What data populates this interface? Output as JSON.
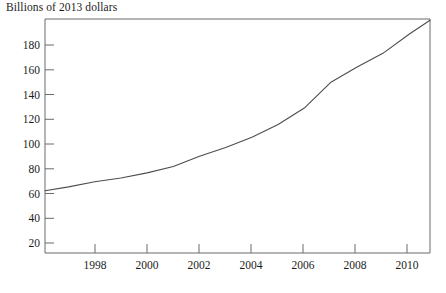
{
  "chart": {
    "title": "Billions of 2013 dollars",
    "y_ticks": [
      "20",
      "40",
      "60",
      "80",
      "100",
      "120",
      "140",
      "160",
      "180"
    ],
    "x_ticks": [
      "1998",
      "2000",
      "2002",
      "2004",
      "2006",
      "2008",
      "2010"
    ],
    "line_color": "#4d4d4d",
    "axis_color": "#6b6b6b"
  },
  "chart_data": {
    "type": "line",
    "title": "Billions of 2013 dollars",
    "xlabel": "",
    "ylabel": "Billions of 2013 dollars",
    "xlim": [
      1996.1,
      2010.8
    ],
    "ylim": [
      4,
      188
    ],
    "grid": false,
    "legend": null,
    "x_tick_values": [
      1998,
      2000,
      2002,
      2004,
      2006,
      2008,
      2010
    ],
    "y_tick_values": [
      20,
      40,
      60,
      80,
      100,
      120,
      140,
      160,
      180
    ],
    "series": [
      {
        "name": "Spending",
        "x": [
          1996.1,
          1997,
          1998,
          1999,
          2000,
          2001,
          2002,
          2003,
          2004,
          2005,
          2006,
          2007,
          2008,
          2009,
          2010,
          2010.8
        ],
        "values": [
          53,
          56,
          60,
          63,
          67,
          72,
          80,
          87,
          95,
          105,
          118,
          138,
          150,
          161,
          176,
          187
        ]
      }
    ]
  }
}
